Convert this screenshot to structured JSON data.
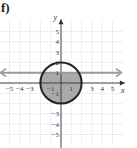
{
  "problem_label": "f)",
  "chart_data": {
    "type": "line",
    "title": "",
    "xlabel": "x",
    "ylabel": "y",
    "xlim": [
      -6,
      6
    ],
    "ylim": [
      -6,
      6
    ],
    "grid": true,
    "x_ticks": [
      -5,
      -4,
      -3,
      -2,
      -1,
      1,
      2,
      3,
      4,
      5
    ],
    "y_ticks": [
      -5,
      -4,
      -3,
      -2,
      -1,
      1,
      2,
      3,
      4,
      5
    ],
    "x_tick_labels_shown": [
      "-5",
      "-4",
      "-3",
      "-1",
      "1",
      "3",
      "4",
      "5"
    ],
    "y_tick_labels_shown": [
      "5",
      "4",
      "3",
      "2",
      "1",
      "-1",
      "-3",
      "-4",
      "-5"
    ],
    "series": [
      {
        "name": "circle",
        "equation": "x^2 + y^2 = 4",
        "center": [
          0,
          0
        ],
        "radius": 2,
        "style": "solid",
        "color": "#222222"
      },
      {
        "name": "line",
        "equation": "y = 1",
        "style": "solid with arrows",
        "color": "#999999"
      }
    ],
    "shaded_region": {
      "description": "inside circle x^2+y^2<=4 and below y=1",
      "color": "#aaaaaa"
    }
  },
  "colors": {
    "grid": "#d0d0d0",
    "axis": "#333333",
    "circle": "#222222",
    "line": "#9a9a9a",
    "fill": "#a9a9a9"
  }
}
